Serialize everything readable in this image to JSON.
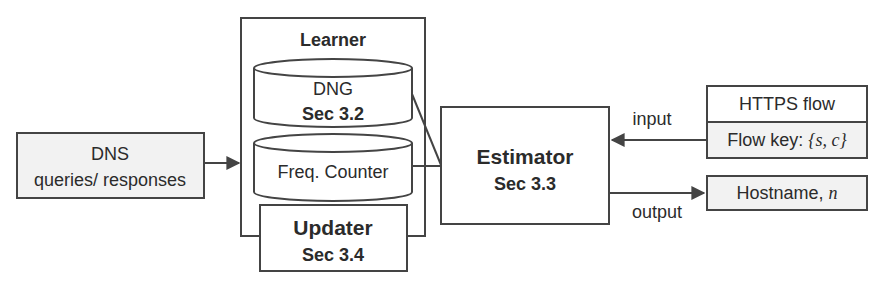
{
  "diagram": {
    "colors": {
      "line": "#444444",
      "text": "#2b2b2b",
      "grey_fill": "#f2f2f2",
      "white_fill": "#ffffff"
    },
    "dns_box": {
      "line1": "DNS",
      "line2": "queries/ responses"
    },
    "learner": {
      "title": "Learner",
      "dng": {
        "name": "DNG",
        "section": "Sec 3.2"
      },
      "freq_counter": {
        "name": "Freq. Counter"
      }
    },
    "updater": {
      "name": "Updater",
      "section": "Sec 3.4"
    },
    "estimator": {
      "name": "Estimator",
      "section": "Sec 3.3"
    },
    "https_flow": {
      "title": "HTTPS flow",
      "key_label": "Flow key: ",
      "key_value": "{s, c}"
    },
    "hostname": {
      "label": "Hostname, ",
      "var": "n"
    },
    "edges": {
      "input_label": "input",
      "output_label": "output"
    }
  }
}
